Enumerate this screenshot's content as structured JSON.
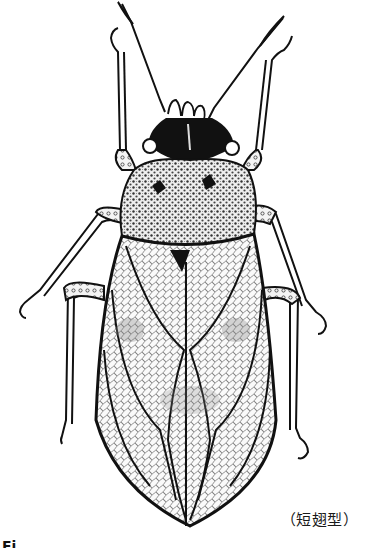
{
  "figure": {
    "caption": "（短翅型）",
    "cropped_label": "Fi",
    "colors": {
      "ink": "#111111",
      "paper": "#ffffff",
      "stipple": "#555555"
    }
  }
}
